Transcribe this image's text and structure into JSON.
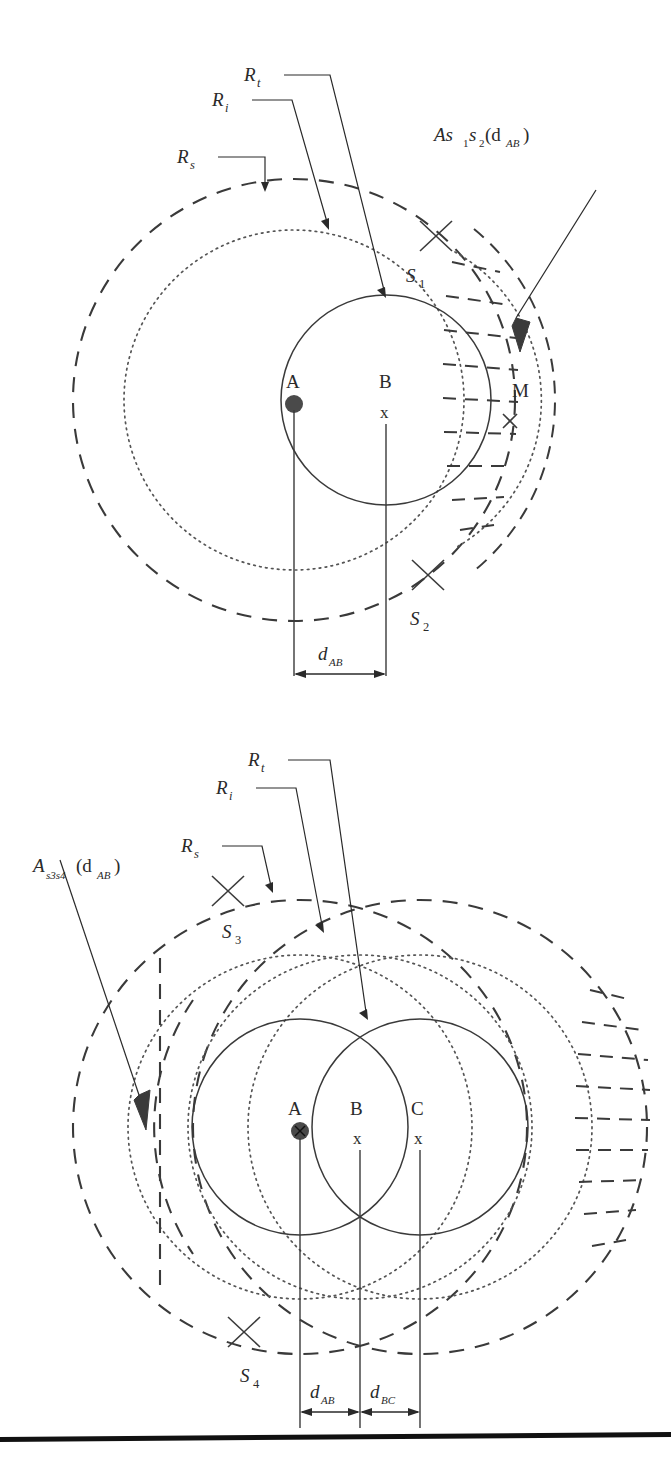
{
  "figure": {
    "panels": [
      {
        "id": "top",
        "name": "panel-one-target",
        "labels": {
          "r_t": "R",
          "r_t_sub": "t",
          "r_i": "R",
          "r_i_sub": "i",
          "r_s": "R",
          "r_s_sub": "s",
          "area": "As",
          "area_sub1": "1",
          "area_mid": "s",
          "area_sub2": "2",
          "area_arg_open": "(d",
          "area_arg_sub": "AB",
          "area_arg_close": ")"
        },
        "points": [
          {
            "id": "A",
            "label": "A",
            "marker": "filled-dot"
          },
          {
            "id": "B",
            "label": "B",
            "marker": "x"
          },
          {
            "id": "M",
            "label": "M",
            "marker": "x"
          }
        ],
        "sensors": [
          {
            "id": "S1",
            "label": "S",
            "sub": "1"
          },
          {
            "id": "S2",
            "label": "S",
            "sub": "2"
          }
        ],
        "dimensions": [
          {
            "id": "dAB",
            "label": "d",
            "sub": "AB"
          }
        ]
      },
      {
        "id": "bottom",
        "name": "panel-two-targets",
        "labels": {
          "r_t": "R",
          "r_t_sub": "t",
          "r_i": "R",
          "r_i_sub": "i",
          "r_s": "R",
          "r_s_sub": "s",
          "area": "A",
          "area_sub": "s3s4",
          "area_arg_open": "(d",
          "area_arg_sub": "AB",
          "area_arg_close": ")"
        },
        "points": [
          {
            "id": "A",
            "label": "A",
            "marker": "filled-dot-x"
          },
          {
            "id": "B",
            "label": "B",
            "marker": "x"
          },
          {
            "id": "C",
            "label": "C",
            "marker": "x"
          }
        ],
        "sensors": [
          {
            "id": "S3",
            "label": "S",
            "sub": "3"
          },
          {
            "id": "S4",
            "label": "S",
            "sub": "4"
          }
        ],
        "dimensions": [
          {
            "id": "dAB",
            "label": "d",
            "sub": "AB"
          },
          {
            "id": "dBC",
            "label": "d",
            "sub": "BC"
          }
        ]
      }
    ],
    "caption_fragment": "",
    "colors": {
      "ink": "#2a2a2a",
      "stroke": "#3a3a3a",
      "dotted": "#555555",
      "rule": "#111111",
      "background": "#ffffff"
    }
  }
}
